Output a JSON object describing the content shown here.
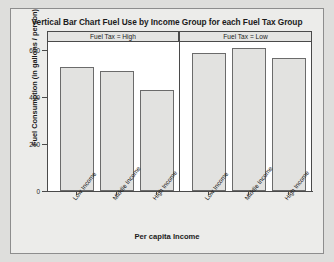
{
  "chart_data": {
    "type": "bar",
    "title": "Vertical Bar Chart Fuel Use by Income Group for each Fuel Tax Group",
    "xlabel": "Per capita Income",
    "ylabel": "Fuel Consumption (in gallons / person)",
    "categories": [
      "Low Income",
      "Middle Income",
      "High Income"
    ],
    "ylim": [
      0,
      680
    ],
    "yticks": [
      0,
      200,
      400,
      600
    ],
    "ytick_labels": [
      "0",
      "200",
      "400",
      "600"
    ],
    "grid": false,
    "legend": "none",
    "panel_variable": "Fuel Tax",
    "panels": [
      {
        "strip_label": "Fuel Tax = High",
        "categories": [
          "Low Income",
          "Middle Income",
          "High Income"
        ],
        "values": [
          565,
          550,
          462
        ]
      },
      {
        "strip_label": "Fuel Tax = Low",
        "categories": [
          "Low Income",
          "Middle Income",
          "High Income"
        ],
        "values": [
          628,
          655,
          605
        ]
      }
    ],
    "series": [
      {
        "name": "Fuel Tax = High",
        "values": [
          565,
          550,
          462
        ]
      },
      {
        "name": "Fuel Tax = Low",
        "values": [
          628,
          655,
          605
        ]
      }
    ],
    "colors": {
      "bar_fill": "#e2e2e0",
      "bar_stroke": "#6b6b6b",
      "panel_background": "#ffffff",
      "figure_background": "#ececea",
      "page_background": "#dededc",
      "axis": "#4a4a4a",
      "text": "#1b1b1b"
    }
  }
}
